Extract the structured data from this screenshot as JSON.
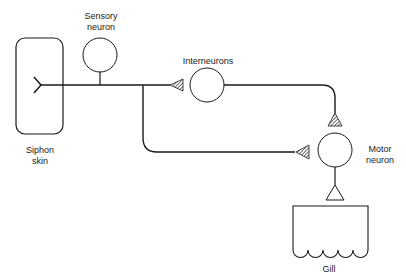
{
  "diagram": {
    "labels": {
      "sensory_neuron": "Sensory\nneuron",
      "interneurons": "Interneurons",
      "motor_neuron": "Motor\nneuron",
      "siphon_skin": "Siphon\nskin",
      "gill": "Gill"
    },
    "nodes": [
      {
        "id": "siphon-skin",
        "label": "Siphon skin",
        "shape": "rounded-rect"
      },
      {
        "id": "sensory-neuron",
        "label": "Sensory neuron",
        "shape": "circle"
      },
      {
        "id": "interneuron",
        "label": "Interneurons",
        "shape": "circle"
      },
      {
        "id": "motor-neuron",
        "label": "Motor neuron",
        "shape": "circle"
      },
      {
        "id": "gill",
        "label": "Gill",
        "shape": "scalloped-box"
      }
    ],
    "edges": [
      {
        "from": "sensory-neuron",
        "to": "interneuron",
        "synapse": "excitatory-hatched"
      },
      {
        "from": "sensory-neuron",
        "to": "motor-neuron",
        "synapse": "excitatory-hatched"
      },
      {
        "from": "interneuron",
        "to": "motor-neuron",
        "synapse": "excitatory-hatched"
      },
      {
        "from": "motor-neuron",
        "to": "gill",
        "synapse": "open-triangle"
      }
    ],
    "colors": {
      "stroke": "#1a1a1a",
      "background": "#ffffff"
    }
  }
}
